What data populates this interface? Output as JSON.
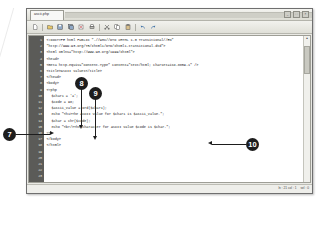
{
  "window": {
    "tab_label": "ascii.php",
    "controls": [
      {
        "name": "minimize",
        "glyph": "_"
      },
      {
        "name": "maximize",
        "glyph": "□"
      },
      {
        "name": "close",
        "glyph": "×"
      }
    ]
  },
  "toolbar": {
    "buttons": [
      {
        "name": "new-file",
        "icon": "new-file-icon"
      },
      {
        "name": "open-file",
        "icon": "open-folder-icon"
      },
      {
        "name": "save-file",
        "icon": "save-disk-icon"
      },
      {
        "name": "save-all",
        "icon": "save-all-icon"
      },
      {
        "name": "close-file",
        "icon": "close-file-icon"
      },
      {
        "name": "print",
        "icon": "printer-icon"
      },
      {
        "name": "cut",
        "icon": "scissors-icon"
      },
      {
        "name": "copy",
        "icon": "copy-icon"
      },
      {
        "name": "paste",
        "icon": "clipboard-icon"
      },
      {
        "name": "undo",
        "icon": "undo-arrow-icon"
      },
      {
        "name": "redo",
        "icon": "redo-arrow-icon"
      }
    ]
  },
  "editor": {
    "line_numbers": [
      "1",
      "2",
      "3",
      "4",
      "5",
      "6",
      "7",
      "8",
      "9",
      "10",
      "11",
      "12",
      "13",
      "14",
      "15",
      "16",
      "17",
      "18",
      "19",
      "20",
      "21"
    ],
    "lines": [
      {
        "n": 1,
        "indent": 0,
        "text": "<!DOCTYPE html PUBLIC \"-//W3C//DTD XHTML 1.0 Transitional//EN\""
      },
      {
        "n": 2,
        "indent": 0,
        "text": "\"http://www.w3.org/TR/xhtml1/DTD/xhtml1-transitional.dtd\">"
      },
      {
        "n": 3,
        "indent": 0,
        "text": "<html xmlns=\"http://www.w3.org/1999/xhtml\">"
      },
      {
        "n": 4,
        "indent": 0,
        "text": "<head>"
      },
      {
        "n": 5,
        "indent": 0,
        "text": "<meta http-equiv=\"Content-Type\" content=\"text/html; charset=iso-8859-1\" />"
      },
      {
        "n": 6,
        "indent": 0,
        "text": "<title>ASCII values</title>"
      },
      {
        "n": 7,
        "indent": 0,
        "text": "</head>"
      },
      {
        "n": 8,
        "indent": 0,
        "text": ""
      },
      {
        "n": 9,
        "indent": 0,
        "text": "<body>"
      },
      {
        "n": 10,
        "indent": 0,
        "text": ""
      },
      {
        "n": 11,
        "indent": 0,
        "text": "<?php"
      },
      {
        "n": 12,
        "indent": 0,
        "text": ""
      },
      {
        "n": 13,
        "indent": 1,
        "text": "$char1 = 'a';"
      },
      {
        "n": 14,
        "indent": 1,
        "text": "$code = 98;"
      },
      {
        "n": 15,
        "indent": 0,
        "text": ""
      },
      {
        "n": 16,
        "indent": 1,
        "text": "$ascii_value = ord($char1);"
      },
      {
        "n": 17,
        "indent": 1,
        "text": "echo \"<h1>The ASCII value for $char1 is $ascii_value.\";"
      },
      {
        "n": 18,
        "indent": 0,
        "text": ""
      },
      {
        "n": 19,
        "indent": 1,
        "text": "$char = chr($code);"
      },
      {
        "n": 20,
        "indent": 1,
        "text": "echo \"<br/>The character for ASCII value $code is $char.\";"
      },
      {
        "n": 21,
        "indent": 0,
        "text": ""
      },
      {
        "n": 22,
        "indent": 0,
        "text": "?>"
      },
      {
        "n": 23,
        "indent": 0,
        "text": "</body>"
      },
      {
        "n": 24,
        "indent": 0,
        "text": "</html>"
      }
    ]
  },
  "statusbar": {
    "position": "ln : 21  col : 1",
    "selection": "sel : 0"
  },
  "callouts": [
    {
      "id": "7",
      "label": "7"
    },
    {
      "id": "8",
      "label": "8"
    },
    {
      "id": "9",
      "label": "9"
    },
    {
      "id": "10",
      "label": "10"
    }
  ],
  "colors": {
    "callout_fill": "#1d1d1d",
    "callout_text": "#ffffff",
    "gutter_bg": "#5b5b58",
    "code_text": "#1b1b1b",
    "window_chrome": "#e9e9e4"
  }
}
